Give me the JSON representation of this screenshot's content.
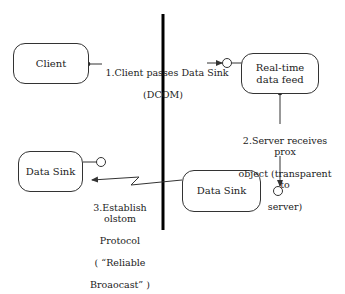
{
  "diagram": {
    "nodes": {
      "client": {
        "label": "Client"
      },
      "realtime_feed": {
        "label": "Real-time data feed"
      },
      "data_sink_left": {
        "label": "Data Sink"
      },
      "data_sink_right": {
        "label": "Data Sink"
      }
    },
    "edges": {
      "step1": {
        "line1": "1.Client passes Data Sink",
        "line2": "(DCOM)"
      },
      "step2": {
        "line1": "2.Server receives prox",
        "line2": "object (transparent to",
        "line3": "server)"
      },
      "step3": {
        "line1": "3.Establish olstom",
        "line2": "Protocol",
        "line3": "( “Reliable",
        "line4": "Broaocast” )"
      }
    },
    "colors": {
      "stroke": "#333333",
      "boundary": "#000000",
      "background": "#ffffff"
    }
  }
}
